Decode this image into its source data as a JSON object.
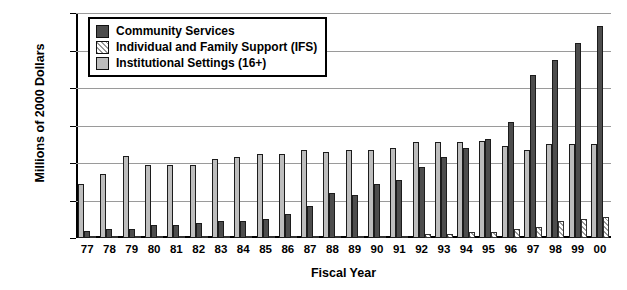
{
  "chart_data": {
    "type": "bar",
    "title": "",
    "xlabel": "Fiscal Year",
    "ylabel": "Millions of 2000 Dollars",
    "ylim": [
      0,
      120
    ],
    "ytick_labels": [
      "$120",
      "$100",
      "$80",
      "$60",
      "$40",
      "$20",
      "$0"
    ],
    "ytick_values": [
      120,
      100,
      80,
      60,
      40,
      20,
      0
    ],
    "grid": true,
    "legend_position": "top-left",
    "categories": [
      "77",
      "78",
      "79",
      "80",
      "81",
      "82",
      "83",
      "84",
      "85",
      "86",
      "87",
      "88",
      "89",
      "90",
      "91",
      "92",
      "93",
      "94",
      "95",
      "96",
      "97",
      "98",
      "99",
      "00"
    ],
    "series": [
      {
        "name": "Community Services",
        "color": "#4d4d4d",
        "pattern": "solid",
        "values": [
          4,
          5,
          5,
          7,
          7,
          8,
          9,
          9,
          10,
          13,
          17,
          24,
          23,
          29,
          31,
          38,
          43,
          48,
          53,
          62,
          87,
          95,
          104,
          113
        ]
      },
      {
        "name": "Individual and Family Support (IFS)",
        "color": "#ffffff",
        "pattern": "diagonal-hatch",
        "values": [
          0,
          0,
          0,
          0,
          0,
          0,
          0,
          0,
          0,
          0,
          0,
          0,
          1,
          1,
          1,
          2,
          2,
          3,
          3,
          5,
          6,
          9,
          10,
          11
        ]
      },
      {
        "name": "Institutional Settings (16+)",
        "color": "#bdbdbd",
        "pattern": "solid",
        "values": [
          29,
          34,
          44,
          39,
          39,
          39,
          42,
          43,
          45,
          45,
          47,
          46,
          47,
          47,
          48,
          51,
          51,
          51,
          52,
          49,
          47,
          50,
          50,
          50
        ]
      }
    ]
  },
  "axis": {
    "y_title": "Millions of 2000 Dollars",
    "x_title": "Fiscal Year"
  },
  "legend": {
    "items": [
      {
        "label": "Community Services",
        "swatch": "cs"
      },
      {
        "label": "Individual and Family Support (IFS)",
        "swatch": "ifs"
      },
      {
        "label": "Institutional Settings (16+)",
        "swatch": "inst"
      }
    ]
  },
  "title_remnant": ""
}
